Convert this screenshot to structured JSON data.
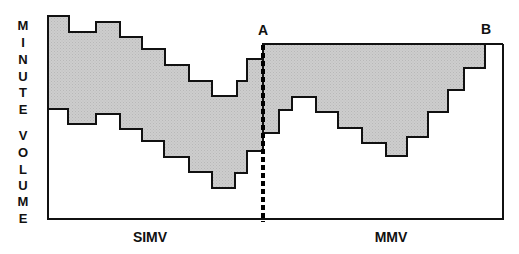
{
  "diagram": {
    "y_axis_label_line1": [
      "M",
      "I",
      "N",
      "U",
      "T",
      "E"
    ],
    "y_axis_label_line2": [
      "V",
      "O",
      "L",
      "U",
      "M",
      "E"
    ],
    "marker_a": "A",
    "marker_b": "B",
    "x_labels": {
      "left": "SIMV",
      "right": "MMV"
    },
    "colors": {
      "fill": "#c9c9c9",
      "stroke": "#111111",
      "background": "#ffffff"
    },
    "frame": {
      "left": 48,
      "top": 44,
      "right": 503,
      "bottom": 219
    },
    "divider_x": 263,
    "simv_band": {
      "upper": [
        [
          48,
          16
        ],
        [
          69,
          16
        ],
        [
          69,
          32
        ],
        [
          96,
          32
        ],
        [
          96,
          22
        ],
        [
          120,
          22
        ],
        [
          120,
          37
        ],
        [
          142,
          37
        ],
        [
          142,
          49
        ],
        [
          165,
          49
        ],
        [
          165,
          65
        ],
        [
          189,
          65
        ],
        [
          189,
          81
        ],
        [
          212,
          81
        ],
        [
          212,
          96
        ],
        [
          237,
          96
        ],
        [
          237,
          81
        ],
        [
          247,
          81
        ],
        [
          247,
          59
        ],
        [
          263,
          59
        ],
        [
          263,
          45
        ]
      ],
      "lower": [
        [
          263,
          151
        ],
        [
          247,
          151
        ],
        [
          247,
          173
        ],
        [
          235,
          173
        ],
        [
          235,
          188
        ],
        [
          212,
          188
        ],
        [
          212,
          172
        ],
        [
          189,
          172
        ],
        [
          189,
          157
        ],
        [
          164,
          157
        ],
        [
          164,
          141
        ],
        [
          142,
          141
        ],
        [
          142,
          129
        ],
        [
          120,
          129
        ],
        [
          120,
          114
        ],
        [
          96,
          114
        ],
        [
          96,
          124
        ],
        [
          68,
          124
        ],
        [
          68,
          109
        ],
        [
          48,
          109
        ]
      ]
    },
    "mmv_band": {
      "upper": [
        [
          263,
          44
        ],
        [
          485,
          44
        ],
        [
          485,
          68
        ],
        [
          464,
          68
        ],
        [
          464,
          90
        ],
        [
          448,
          90
        ],
        [
          448,
          112
        ],
        [
          428,
          112
        ],
        [
          428,
          137
        ],
        [
          407,
          137
        ],
        [
          407,
          156
        ],
        [
          386,
          156
        ],
        [
          386,
          143
        ],
        [
          362,
          143
        ],
        [
          362,
          128
        ],
        [
          338,
          128
        ],
        [
          338,
          112
        ],
        [
          316,
          112
        ],
        [
          316,
          97
        ],
        [
          292,
          97
        ],
        [
          292,
          110
        ],
        [
          279,
          110
        ],
        [
          279,
          133
        ],
        [
          263,
          133
        ]
      ]
    }
  }
}
